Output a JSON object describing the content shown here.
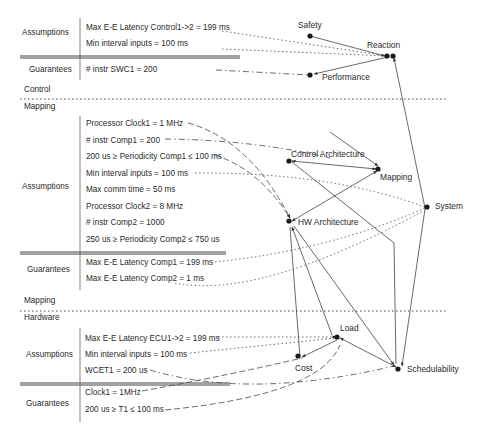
{
  "control_block": {
    "assumptions_label": "Assumptions",
    "assumptions": [
      "Max E-E Latency Control1->2 = 199 ms",
      "Min interval inputs = 100 ms"
    ],
    "guarantees_label": "Guarantees",
    "guarantees": [
      "# instr SWC1  = 200"
    ]
  },
  "sep1": {
    "above": "Control",
    "below": "Mapping"
  },
  "mapping_block": {
    "assumptions_label": "Assumptions",
    "assumptions": [
      "Processor Clock1 = 1 MHz",
      "# instr Comp1  = 200",
      "200 us ≥ Periodicity Comp1  ≤ 100 ms",
      "Min interval inputs = 100 ms",
      "Max comm time = 50 ms",
      "Processor Clock2 = 8 MHz",
      "# instr Comp2  = 1000",
      "250 us ≥ Periodicity Comp2  ≤ 750 us"
    ],
    "guarantees_label": "Guarantees",
    "guarantees": [
      "Max E-E Latency Comp1 = 199 ms",
      "Max E-E Latency Comp2 = 1 ms"
    ]
  },
  "sep2": {
    "above": "Mapping",
    "below": "Hardware"
  },
  "hardware_block": {
    "assumptions_label": "Assumptions",
    "assumptions": [
      "Max E-E Latency ECU1->2 = 199 ms",
      "Min interval inputs = 100 ms",
      "WCET1 = 200 us"
    ],
    "guarantees_label": "Guarantees",
    "guarantees": [
      "Clock1 = 1MHz",
      "200 us ≥ T1 ≤ 100 ms"
    ]
  },
  "nodes": {
    "safety": "Safety",
    "reaction": "Reaction",
    "performance": "Performance",
    "control_architecture": "Control Architecture",
    "mapping": "Mapping",
    "system": "System",
    "hw_architecture": "HW Architecture",
    "load": "Load",
    "cost": "Cost",
    "schedulability": "Schedulability"
  },
  "colors": {
    "ink": "#2a2a2a",
    "line": "#555555"
  }
}
